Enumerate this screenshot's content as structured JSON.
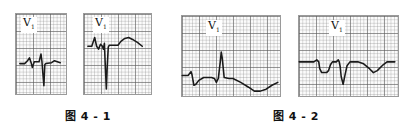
{
  "figures": [
    {
      "caption": "图 4 - 1",
      "panels": [
        {
          "lead": "V",
          "lead_sub": "1"
        },
        {
          "lead": "V",
          "lead_sub": "1"
        }
      ]
    },
    {
      "caption": "图 4 - 2",
      "panels": [
        {
          "lead": "V",
          "lead_sub": "1"
        },
        {
          "lead": "V",
          "lead_sub": "1"
        }
      ]
    }
  ],
  "colors": {
    "grid_major": "#5a5a5a",
    "grid_minor": "#8c8c8c",
    "trace": "#1a1a1a",
    "background": "#ffffff"
  }
}
